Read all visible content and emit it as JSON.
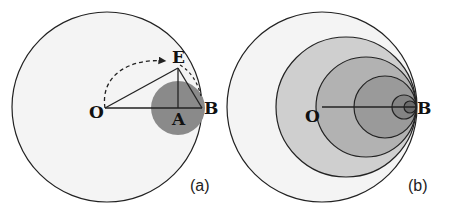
{
  "panels": [
    {
      "id": "a",
      "caption": "(a)",
      "labels": {
        "O": "O",
        "E": "E",
        "A": "A",
        "B": "B"
      }
    },
    {
      "id": "b",
      "caption": "(b)",
      "labels": {
        "O": "O",
        "B": "B"
      }
    }
  ],
  "colors": {
    "outer_fill": "#f3f3f3",
    "small_disc_a": "#8a8a8a",
    "nested_fills": [
      "#f3f3f3",
      "#cfcfcf",
      "#b4b4b4",
      "#9c9c9c",
      "#858585",
      "#6e6e6e"
    ],
    "stroke": "#222222"
  }
}
